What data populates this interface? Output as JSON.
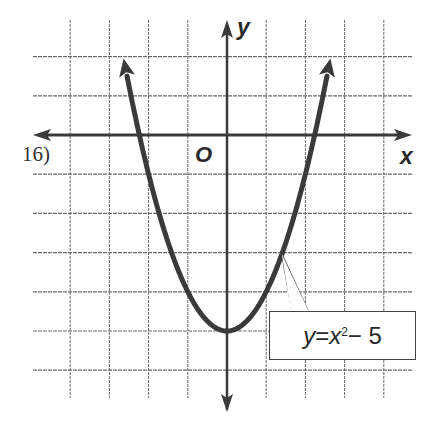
{
  "problem": {
    "number": "16)"
  },
  "chart_data": {
    "type": "line",
    "title": "",
    "function": "y = x^2 - 5",
    "xlabel": "x",
    "ylabel": "y",
    "origin_label": "O",
    "xlim": [
      -4,
      4
    ],
    "ylim": [
      -6,
      2
    ],
    "grid": true,
    "grid_step": 1,
    "x": [
      -2.6,
      -2,
      -1,
      0,
      1,
      2,
      2.6
    ],
    "y": [
      1.76,
      -1,
      -4,
      -5,
      -4,
      -1,
      1.76
    ],
    "vertex": [
      0,
      -5
    ],
    "annotations": [
      {
        "text": "y = x² − 5",
        "points_to": [
          1.4,
          -3.04
        ]
      }
    ]
  },
  "labels": {
    "eq_y": "y",
    "eq_eq": " = ",
    "eq_x": "x",
    "eq_exp": "2",
    "eq_rest": " − 5"
  },
  "style": {
    "ink": "#3a3a3a",
    "grid": "#6a6a6a"
  }
}
